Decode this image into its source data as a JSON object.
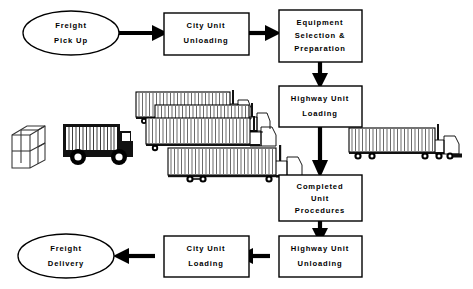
{
  "diagram": {
    "background_color": "#ffffff",
    "ink_color": "#000000"
  },
  "nodes": {
    "freight_pickup": {
      "label_lines": [
        "Freight",
        "Pick Up"
      ],
      "shape": "ellipse"
    },
    "city_unit_unloading": {
      "label_lines": [
        "City Unit",
        "Unloading"
      ],
      "shape": "rect"
    },
    "equipment_selection": {
      "label_lines": [
        "Equipment",
        "Selection &",
        "Preparation"
      ],
      "shape": "rect"
    },
    "highway_unit_loading": {
      "label_lines": [
        "Highway Unit",
        "Loading"
      ],
      "shape": "rect"
    },
    "completed_unit_procedures": {
      "label_lines": [
        "Completed",
        "Unit",
        "Procedures"
      ],
      "shape": "rect"
    },
    "highway_unit_unloading": {
      "label_lines": [
        "Highway Unit",
        "Unloading"
      ],
      "shape": "rect"
    },
    "city_unit_loading": {
      "label_lines": [
        "City Unit",
        "Loading"
      ],
      "shape": "rect"
    },
    "freight_delivery": {
      "label_lines": [
        "Freight",
        "Delivery"
      ],
      "shape": "ellipse"
    }
  },
  "illustrations": {
    "package_cube": {
      "name": "package-cube",
      "description": "wireframe crate"
    },
    "city_box_truck": {
      "name": "city-delivery-truck",
      "description": "black box truck with ribbed cargo body"
    },
    "trailer_stack": {
      "name": "stacked-semi-trailers",
      "count": 4,
      "description": "four cascading tractor-trailers"
    },
    "highway_semi": {
      "name": "highway-semi-truck",
      "description": "single tractor trailer"
    }
  },
  "flow": {
    "edges": [
      {
        "from": "freight_pickup",
        "to": "city_unit_unloading",
        "direction": "right"
      },
      {
        "from": "city_unit_unloading",
        "to": "equipment_selection",
        "direction": "right"
      },
      {
        "from": "equipment_selection",
        "to": "highway_unit_loading",
        "direction": "down"
      },
      {
        "from": "highway_unit_loading",
        "to": "completed_unit_procedures",
        "direction": "down"
      },
      {
        "from": "completed_unit_procedures",
        "to": "highway_unit_unloading",
        "direction": "down"
      },
      {
        "from": "highway_unit_unloading",
        "to": "city_unit_loading",
        "direction": "left"
      },
      {
        "from": "city_unit_loading",
        "to": "freight_delivery",
        "direction": "left"
      }
    ]
  }
}
